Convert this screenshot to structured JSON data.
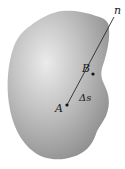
{
  "diagram": {
    "body_color": "#9a9a9a",
    "highlight_color": "#e6e6e6",
    "line_color": "#2a2a2a",
    "labels": {
      "direction": "n",
      "point_b": "B",
      "point_a": "A",
      "segment_length": "Δs"
    },
    "points": {
      "A": {
        "x": 67,
        "y": 105
      },
      "B": {
        "x": 93,
        "y": 74
      },
      "n_end": {
        "x": 114,
        "y": 17
      }
    }
  }
}
